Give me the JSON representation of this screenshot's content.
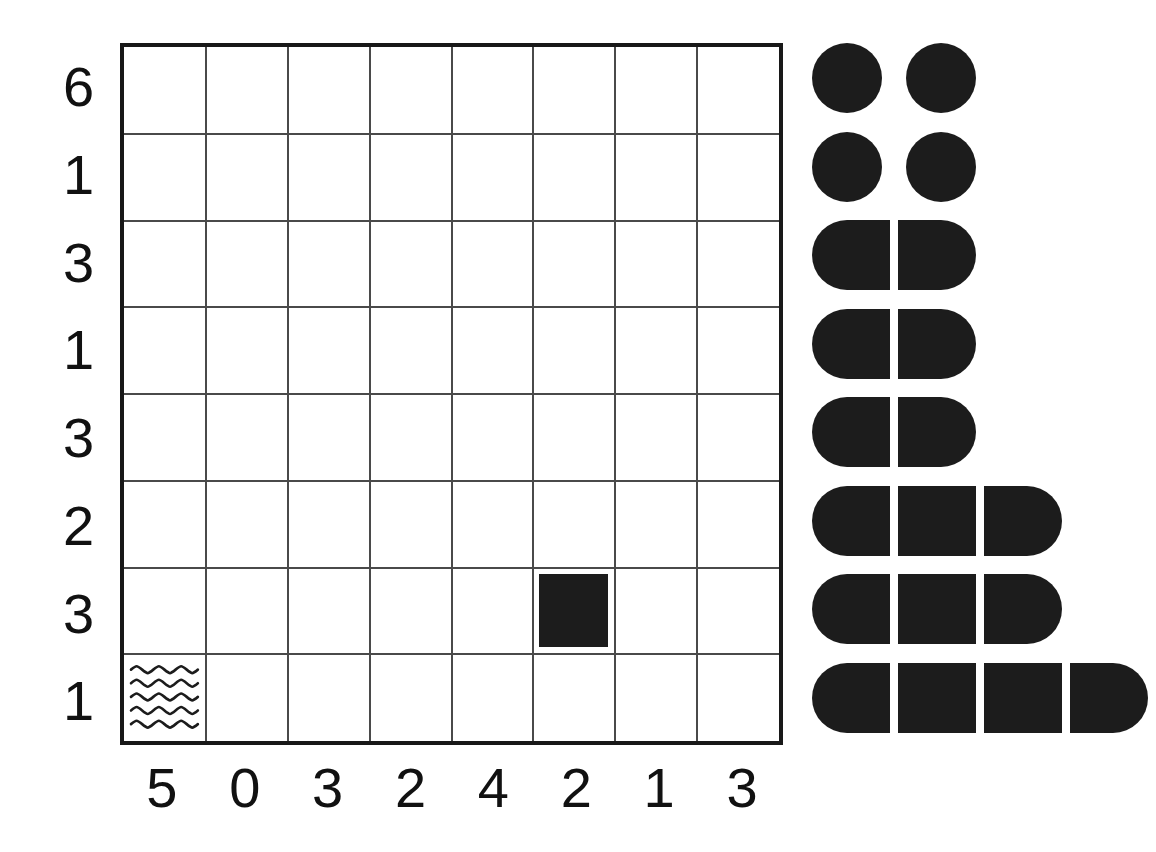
{
  "puzzle": {
    "type": "battleships-bimaru",
    "grid": {
      "rows": 8,
      "cols": 8,
      "row_clues": [
        "6",
        "1",
        "3",
        "1",
        "3",
        "2",
        "3",
        "1"
      ],
      "col_clues": [
        "5",
        "0",
        "3",
        "2",
        "4",
        "2",
        "1",
        "3"
      ],
      "given_cells": [
        {
          "row": 6,
          "col": 5,
          "kind": "ship-middle",
          "name": "ship-middle-segment"
        },
        {
          "row": 7,
          "col": 0,
          "kind": "water",
          "name": "water-cell"
        }
      ]
    },
    "fleet": {
      "label": "fleet",
      "rows": [
        {
          "size": 1,
          "shapes": [
            "single",
            "single"
          ],
          "count_in_row": 2
        },
        {
          "size": 1,
          "shapes": [
            "single",
            "single"
          ],
          "count_in_row": 2
        },
        {
          "size": 2,
          "shapes": [
            "left",
            "right"
          ],
          "count_in_row": 1
        },
        {
          "size": 2,
          "shapes": [
            "left",
            "right"
          ],
          "count_in_row": 1
        },
        {
          "size": 2,
          "shapes": [
            "left",
            "right"
          ],
          "count_in_row": 1
        },
        {
          "size": 3,
          "shapes": [
            "left",
            "mid",
            "right"
          ],
          "count_in_row": 1
        },
        {
          "size": 3,
          "shapes": [
            "left",
            "mid",
            "right"
          ],
          "count_in_row": 1
        },
        {
          "size": 4,
          "shapes": [
            "left",
            "mid",
            "mid",
            "right"
          ],
          "count_in_row": 1
        }
      ]
    },
    "colors": {
      "ink": "#1c1c1c",
      "border": "#181818",
      "gridline": "#4a4a4a",
      "background": "#ffffff",
      "label": "#111111"
    }
  }
}
